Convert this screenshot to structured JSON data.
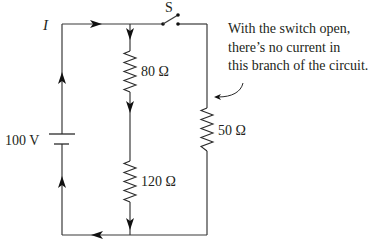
{
  "diagram": {
    "current_label": "I",
    "switch_label": "S",
    "battery": {
      "label": "100 V",
      "voltage": 100,
      "unit": "V"
    },
    "resistors": [
      {
        "id": "R1",
        "label": "80 Ω",
        "value": 80,
        "unit": "Ω",
        "branch": "middle-upper"
      },
      {
        "id": "R2",
        "label": "120 Ω",
        "value": 120,
        "unit": "Ω",
        "branch": "middle-lower"
      },
      {
        "id": "R3",
        "label": "50 Ω",
        "value": 50,
        "unit": "Ω",
        "branch": "right"
      }
    ],
    "switch": {
      "state": "open"
    },
    "annotation": {
      "lines": [
        "With the switch open,",
        "there’s no current in",
        "this branch of the circuit."
      ]
    },
    "colors": {
      "wire": "#3a3a3a",
      "text": "#231f20",
      "background": "#ffffff"
    }
  }
}
